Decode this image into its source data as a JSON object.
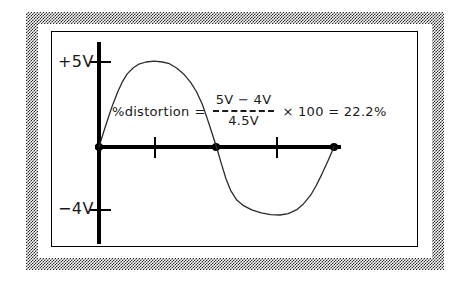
{
  "figure": {
    "frame": {
      "outer_border_style": "dithered-gray-checkerboard",
      "inner_border_color": "#000000",
      "background_color": "#ffffff"
    }
  },
  "axes": {
    "y_axis_label_positive": "+5V",
    "y_axis_label_negative": "−4V",
    "axis_color": "#000000",
    "x_tick_count": 2,
    "y_tick_count": 2
  },
  "formula": {
    "lead_text": "%distortion",
    "equals_sign": "=",
    "numerator": "5V − 4V",
    "denominator": "4.5V",
    "fraction_bar_style": "dashed",
    "tail_text": "× 100 = 22.2%",
    "multiply_symbol": "×",
    "multiplier": "100",
    "result": "22.2%"
  },
  "chart_data": {
    "type": "line",
    "xlabel": "",
    "ylabel": "Voltage",
    "ylim": [
      -5,
      6
    ],
    "xlim": [
      0,
      1
    ],
    "grid": false,
    "legend": null,
    "annotations": [
      {
        "text": "+5V",
        "type": "y-tick-label",
        "value": 5
      },
      {
        "text": "−4V",
        "type": "y-tick-label",
        "value": -4
      },
      {
        "text": "%distortion = (5V − 4V) / 4.5V × 100 = 22.2%",
        "type": "formula"
      }
    ],
    "series": [
      {
        "name": "distorted waveform",
        "description": "Sine wave with flattened (clipped) positive peak at +5V and shallower negative trough at −4V",
        "positive_peak_voltage": 5,
        "negative_peak_voltage": -4,
        "average_peak_voltage": 4.5,
        "distortion_percent": 22.2,
        "zero_crossings_x": [
          0.0,
          0.5,
          1.0
        ],
        "points": [
          [
            0.0,
            0.0
          ],
          [
            0.02,
            0.9
          ],
          [
            0.04,
            1.75
          ],
          [
            0.06,
            2.55
          ],
          [
            0.08,
            3.25
          ],
          [
            0.1,
            3.85
          ],
          [
            0.12,
            4.3
          ],
          [
            0.145,
            4.65
          ],
          [
            0.17,
            4.88
          ],
          [
            0.2,
            5.0
          ],
          [
            0.235,
            5.05
          ],
          [
            0.27,
            5.0
          ],
          [
            0.3,
            4.9
          ],
          [
            0.33,
            4.65
          ],
          [
            0.36,
            4.3
          ],
          [
            0.39,
            3.8
          ],
          [
            0.415,
            3.25
          ],
          [
            0.44,
            2.5
          ],
          [
            0.46,
            1.7
          ],
          [
            0.48,
            0.85
          ],
          [
            0.5,
            0.0
          ],
          [
            0.52,
            -0.95
          ],
          [
            0.54,
            -1.85
          ],
          [
            0.56,
            -2.55
          ],
          [
            0.585,
            -3.1
          ],
          [
            0.615,
            -3.45
          ],
          [
            0.65,
            -3.7
          ],
          [
            0.69,
            -3.88
          ],
          [
            0.73,
            -3.98
          ],
          [
            0.77,
            -4.0
          ],
          [
            0.805,
            -3.92
          ],
          [
            0.84,
            -3.7
          ],
          [
            0.87,
            -3.35
          ],
          [
            0.9,
            -2.85
          ],
          [
            0.925,
            -2.25
          ],
          [
            0.95,
            -1.55
          ],
          [
            0.975,
            -0.8
          ],
          [
            1.0,
            0.0
          ]
        ]
      }
    ]
  }
}
